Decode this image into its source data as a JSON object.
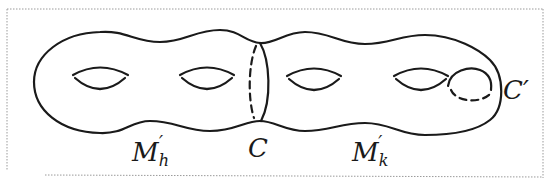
{
  "figure": {
    "labels": {
      "left_part": "M",
      "left_part_sub": "h",
      "left_part_prime": "′",
      "separating_curve": "C",
      "right_part": "M",
      "right_part_sub": "k",
      "right_part_prime": "′",
      "handle_curve": "C′"
    },
    "colors": {
      "line": "#1a1a1a",
      "frame": "#9a9a9a",
      "background": "#ffffff"
    },
    "genus": 4
  }
}
